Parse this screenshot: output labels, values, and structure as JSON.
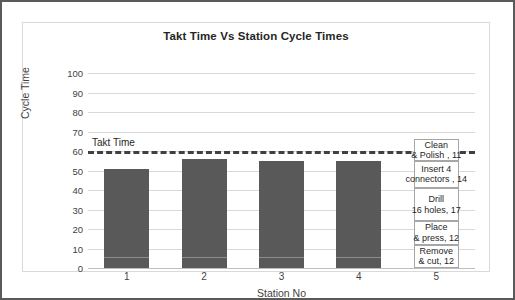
{
  "chart_data": {
    "type": "bar",
    "title": "Takt Time Vs Station Cycle Times",
    "xlabel": "Station No",
    "ylabel": "Cycle Time",
    "categories": [
      "1",
      "2",
      "3",
      "4",
      "5"
    ],
    "values": [
      51,
      56,
      55,
      55,
      66
    ],
    "ylim": [
      0,
      100
    ],
    "yticks": [
      "0",
      "10",
      "20",
      "30",
      "40",
      "50",
      "60",
      "70",
      "80",
      "90",
      "100"
    ],
    "ytick_values": [
      0,
      10,
      20,
      30,
      40,
      50,
      60,
      70,
      80,
      90,
      100
    ],
    "grid": true,
    "legend": "none",
    "bar_color": "#595959",
    "gridline_color": "#d9d9d9",
    "annotations": [
      {
        "name": "takt-time",
        "label": "Takt Time",
        "value": 60,
        "style": "dashed-horizontal-line",
        "color": "#404040"
      }
    ],
    "station5_labels": [
      {
        "line1": "Clean",
        "line2": "& Polish , 11",
        "value": 11
      },
      {
        "line1": "Insert 4",
        "line2": "connectors , 14",
        "value": 14
      },
      {
        "line1": "Drill",
        "line2": "16 holes, 17",
        "value": 17
      },
      {
        "line1": "Place",
        "line2": "& press, 12",
        "value": 12
      },
      {
        "line1": "Remove",
        "line2": "& cut, 12",
        "value": 12
      }
    ]
  }
}
